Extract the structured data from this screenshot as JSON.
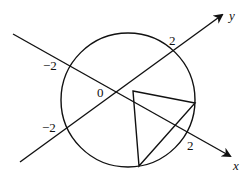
{
  "diagram": {
    "type": "geometry-figure",
    "colors": {
      "stroke": "#111111",
      "background": "#ffffff"
    },
    "axes": {
      "x": {
        "label": "x",
        "tick_positive": "2",
        "tick_negative": "−2"
      },
      "y": {
        "label": "y",
        "tick_positive": "2",
        "tick_negative": "−2"
      },
      "origin_label": "0"
    },
    "circle": {
      "center_px": [
        128,
        100
      ],
      "radius_px": 67
    },
    "triangle": {
      "vertices_px": [
        [
          133,
          91
        ],
        [
          195,
          103
        ],
        [
          139,
          166
        ]
      ]
    }
  }
}
